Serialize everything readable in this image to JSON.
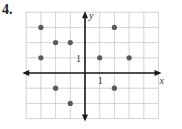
{
  "problem_number": "4.",
  "graph": {
    "x_axis_label": "x",
    "y_axis_label": "y",
    "x_tick_label": "1",
    "y_tick_label": "1",
    "x_range": [
      -4,
      5
    ],
    "y_range": [
      -3,
      4
    ],
    "origin_px": [
      85,
      73
    ],
    "unit_px": [
      14.7,
      15.2
    ],
    "grid_color": "#c8c8c8",
    "axis_color": "#1a1a1a",
    "point_color": "#5a5a5a",
    "points": [
      {
        "x": -3,
        "y": 3
      },
      {
        "x": 2,
        "y": 3
      },
      {
        "x": -2,
        "y": 2
      },
      {
        "x": -1,
        "y": 2
      },
      {
        "x": -3,
        "y": 1
      },
      {
        "x": 1,
        "y": 1
      },
      {
        "x": 3,
        "y": 1
      },
      {
        "x": -2,
        "y": -1
      },
      {
        "x": 2,
        "y": -1
      },
      {
        "x": -1,
        "y": -2
      }
    ]
  }
}
